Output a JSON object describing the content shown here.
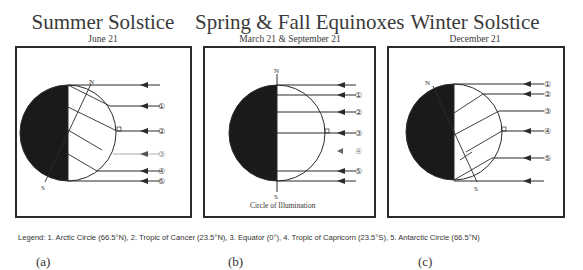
{
  "panels": [
    {
      "title": "Summer Solstice",
      "subtitle": "June 21",
      "label": "(a)"
    },
    {
      "title": "Spring & Fall Equinoxes",
      "subtitle": "March 21 & September 21",
      "label": "(b)",
      "caption": "Circle of Illumination"
    },
    {
      "title": "Winter Solstice",
      "subtitle": "December 21",
      "label": "(c)"
    }
  ],
  "pole_labels": {
    "north": "N",
    "south": "S"
  },
  "ray_markers": [
    "①",
    "②",
    "③",
    "④",
    "⑤"
  ],
  "legend": "Legend: 1. Arctic Circle (66.5°N),    2. Tropic of Cancer (23.5°N),    3. Equator (0°),    4. Tropic of Capricorn (23.5°S),    5. Antarctic Circle (66.5°N)",
  "colors": {
    "night": "#1a1a1a",
    "line": "#2b2b2b",
    "faint": "#9a9a9a"
  }
}
